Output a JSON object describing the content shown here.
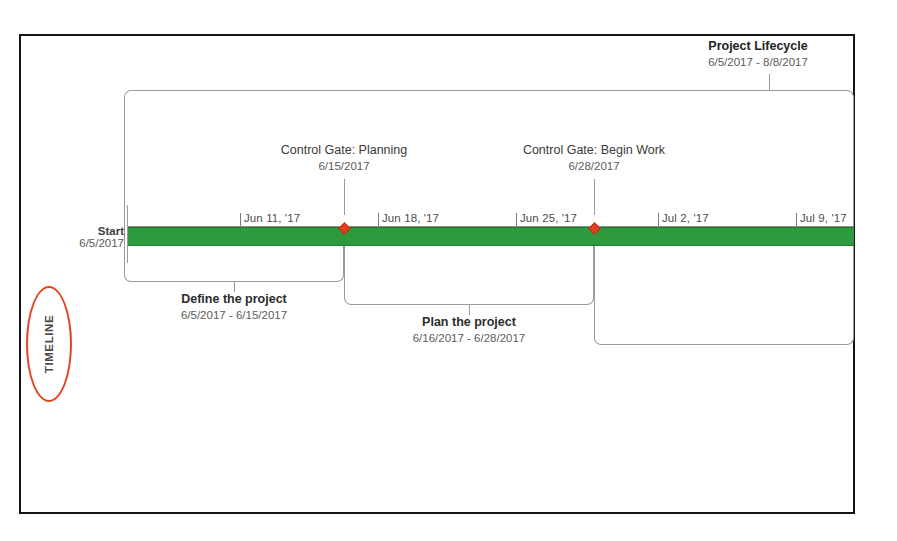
{
  "document": {
    "title": "Project Timeline View",
    "background_color": "#ffffff",
    "frame_color": "#151515"
  },
  "annotation": {
    "label": "TIMELINE",
    "highlight_shape": "ellipse",
    "highlight_color": "#e4441c"
  },
  "timeline": {
    "bar_color": "#2e9a3e",
    "start": {
      "label": "Start",
      "date": "6/5/2017"
    },
    "ticks": [
      {
        "label": "Jun 11, '17",
        "x": 240
      },
      {
        "label": "Jun 18, '17",
        "x": 378
      },
      {
        "label": "Jun 25, '17",
        "x": 516
      },
      {
        "label": "Jul 2, '17",
        "x": 658
      },
      {
        "label": "Jul 9, '17",
        "x": 796
      }
    ]
  },
  "lifecycle": {
    "title": "Project Lifecycle",
    "dates": "6/5/2017 - 8/8/2017"
  },
  "milestones": [
    {
      "name": "Control Gate: Planning",
      "date": "6/15/2017",
      "marker_x": 344,
      "marker_color": "#e0401c"
    },
    {
      "name": "Control Gate: Begin Work",
      "date": "6/28/2017",
      "marker_x": 594,
      "marker_color": "#e0401c"
    }
  ],
  "tasks": [
    {
      "name": "Define the project",
      "dates": "6/5/2017 - 6/15/2017"
    },
    {
      "name": "Plan the project",
      "dates": "6/16/2017 - 6/28/2017"
    }
  ]
}
